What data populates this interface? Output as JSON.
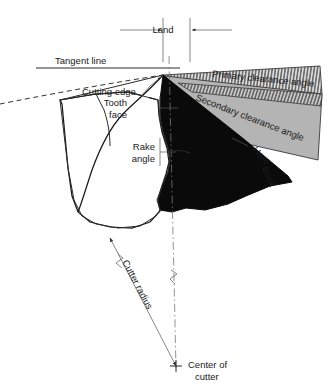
{
  "figure": {
    "background_color": "#ffffff",
    "width": 334,
    "height": 387
  },
  "labels": {
    "land": "Land",
    "tangent_line": "Tangent line",
    "cutting_edge": "Cutting edge",
    "primary_clearance_angle": "Primary clearance angle",
    "secondary_clearance_angle": "Secondary clearance angle",
    "tooth_face_line1": "Tooth",
    "tooth_face_line2": "face",
    "rake_angle_line1": "Rake",
    "rake_angle_line2": "angle",
    "heel": "Heel",
    "back": "Back",
    "cutter_radius": "Cutter radius",
    "center_of_cutter_line1": "Center of",
    "center_of_cutter_line2": "cutter"
  },
  "colors": {
    "line": "#2b2b2b",
    "body_fill": "#ffffff",
    "tooth_dark": "#0a0a0a",
    "secondary_band": "#b2b2b2",
    "primary_band": "#d8d8d8",
    "hatch": "#3a3a3a",
    "center_line": "#777777",
    "text": "#1a1a1a"
  },
  "geometry": {
    "cutting_edge_point": "163,75",
    "center_of_cutter_point": "176,368",
    "land_left_x": 163,
    "land_right_x": 190,
    "tangent_line_y": 68
  }
}
